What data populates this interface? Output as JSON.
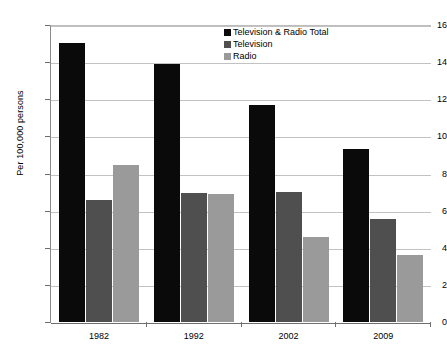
{
  "chart_data": {
    "type": "bar",
    "title": "",
    "subtitle": "",
    "xlabel": "",
    "ylabel": "Per 100,000 persons",
    "categories": [
      "1982",
      "1992",
      "2002",
      "2009"
    ],
    "ylim": [
      0,
      16
    ],
    "yticks": [
      0,
      2,
      4,
      6,
      8,
      10,
      12,
      14,
      16
    ],
    "ytick_labels": [
      "0",
      "2",
      "4",
      "6",
      "8",
      "10",
      "12",
      "14",
      "16"
    ],
    "grid": true,
    "legend_position": "top-center",
    "series": [
      {
        "name": "Television & Radio Total",
        "color": "#0a0a0a",
        "values": [
          15.05,
          13.9,
          11.7,
          9.3
        ]
      },
      {
        "name": "Television",
        "color": "#4f4f4f",
        "values": [
          6.6,
          6.95,
          7.0,
          5.55
        ]
      },
      {
        "name": "Radio",
        "color": "#9a9a9a",
        "values": [
          8.45,
          6.9,
          4.6,
          3.6
        ]
      }
    ]
  }
}
